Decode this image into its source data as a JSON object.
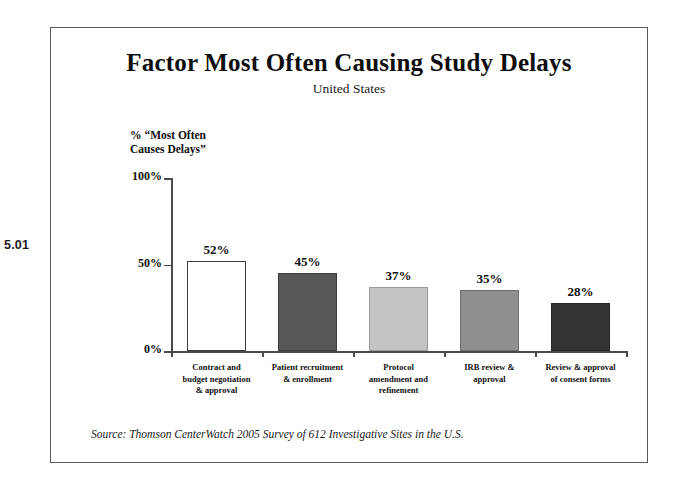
{
  "figure_number": "5.01",
  "chart_data": {
    "type": "bar",
    "title": "Factor Most Often Causing Study Delays",
    "subtitle": "United States",
    "xlabel": "",
    "ylabel": "% “Most Often\nCauses Delays”",
    "ylim": [
      0,
      100
    ],
    "ytick_labels": [
      "0%",
      "50%",
      "100%"
    ],
    "ytick_values": [
      0,
      50,
      100
    ],
    "grid": false,
    "legend": "none",
    "categories": [
      "Contract and\nbudget negotiation\n& approval",
      "Patient recruitment\n& enrollment",
      "Protocol\namendment and\nrefinement",
      "IRB review &\napproval",
      "Review & approval\nof consent forms"
    ],
    "values": [
      52,
      45,
      37,
      35,
      28
    ],
    "value_labels": [
      "52%",
      "45%",
      "37%",
      "35%",
      "28%"
    ],
    "bar_colors": [
      "#ffffff",
      "#575757",
      "#c4c4c4",
      "#8f8f8f",
      "#333333"
    ],
    "bar_border_colors": [
      "#3d3d3d",
      "#3d3d3d",
      "#9a9a9a",
      "#6e6e6e",
      "#262626"
    ],
    "source": "Source:  Thomson CenterWatch 2005 Survey of 612 Investigative Sites in the U.S."
  },
  "colors": {
    "frame": "#5a5a5a",
    "axis": "#4a4a4a",
    "text": "#0d0d0d"
  }
}
